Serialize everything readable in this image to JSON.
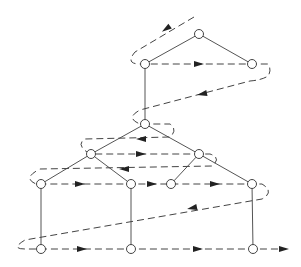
{
  "diagram": {
    "type": "tree-level-order-traversal",
    "nodes": [
      {
        "id": "n0",
        "x": 199,
        "y": 34
      },
      {
        "id": "n1",
        "x": 145,
        "y": 64
      },
      {
        "id": "n2",
        "x": 252,
        "y": 64
      },
      {
        "id": "n3",
        "x": 145,
        "y": 124
      },
      {
        "id": "n4",
        "x": 91,
        "y": 154
      },
      {
        "id": "n5",
        "x": 199,
        "y": 154
      },
      {
        "id": "n6",
        "x": 41,
        "y": 184
      },
      {
        "id": "n7",
        "x": 131,
        "y": 184
      },
      {
        "id": "n8",
        "x": 171,
        "y": 184
      },
      {
        "id": "n9",
        "x": 252,
        "y": 184
      },
      {
        "id": "n10",
        "x": 41,
        "y": 249
      },
      {
        "id": "n11",
        "x": 131,
        "y": 249
      },
      {
        "id": "n12",
        "x": 253,
        "y": 249
      }
    ],
    "edges": [
      [
        "n0",
        "n1"
      ],
      [
        "n0",
        "n2"
      ],
      [
        "n1",
        "n3"
      ],
      [
        "n3",
        "n4"
      ],
      [
        "n3",
        "n5"
      ],
      [
        "n4",
        "n6"
      ],
      [
        "n4",
        "n7"
      ],
      [
        "n5",
        "n8"
      ],
      [
        "n5",
        "n9"
      ],
      [
        "n6",
        "n10"
      ],
      [
        "n7",
        "n11"
      ],
      [
        "n9",
        "n12"
      ]
    ],
    "traversal_path": "M194,17 L135,52 Q125,64 140,64 L268,64 Q272,70 268,76 Q262,80 250,81 L140,110 Q125,118 140,124 L170,124 Q178,130 170,137 L85,139 Q75,145 90,154 L210,154 Q222,158 212,166 L40,169 Q22,178 36,184 L262,184 Q275,192 262,199 L25,240 Q10,249 25,249 L285,249",
    "arrows": [
      {
        "x": 166,
        "y": 29,
        "angle": 145
      },
      {
        "x": 199,
        "y": 64,
        "angle": 0
      },
      {
        "x": 202,
        "y": 94,
        "angle": 168
      },
      {
        "x": 141,
        "y": 139,
        "angle": 180
      },
      {
        "x": 141,
        "y": 154,
        "angle": 0
      },
      {
        "x": 124,
        "y": 169,
        "angle": 180
      },
      {
        "x": 80,
        "y": 184,
        "angle": 0
      },
      {
        "x": 152,
        "y": 184,
        "angle": 0
      },
      {
        "x": 215,
        "y": 184,
        "angle": 0
      },
      {
        "x": 192,
        "y": 208,
        "angle": 168
      },
      {
        "x": 82,
        "y": 249,
        "angle": 0
      },
      {
        "x": 198,
        "y": 249,
        "angle": 0
      },
      {
        "x": 284,
        "y": 249,
        "angle": 0
      }
    ]
  }
}
